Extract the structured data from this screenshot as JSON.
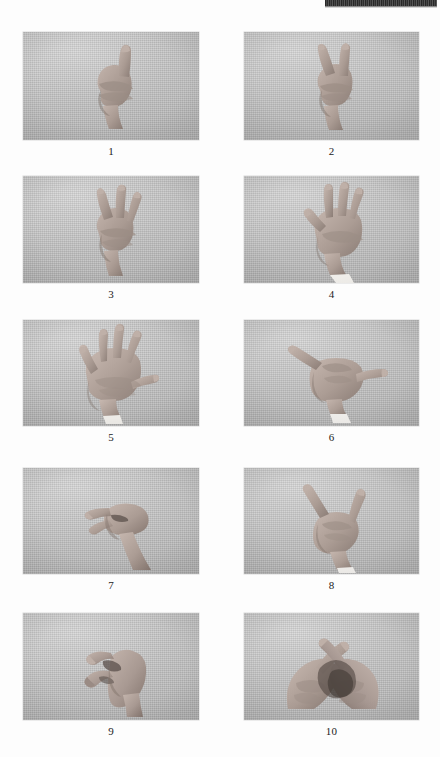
{
  "page": {
    "kind": "scanned-figure-plate",
    "background_color": "#fdfdfd",
    "photo_background_color": "#c2c2c2",
    "skin_color": "#b0a099",
    "caption_color": "#1b1b1b",
    "artifact_color": "#222222"
  },
  "artifact": {
    "name": "scan-edge-artifact",
    "description": ""
  },
  "figures": [
    {
      "number": "1",
      "caption": "1",
      "gesture": "index-finger-extended-one",
      "hand_count": 1,
      "sleeve_visible": false,
      "x": 23,
      "y": 32,
      "w": 176,
      "h": 108,
      "caption_y": 145
    },
    {
      "number": "2",
      "caption": "2",
      "gesture": "index-and-middle-finger-extended-two",
      "hand_count": 1,
      "sleeve_visible": false,
      "x": 244,
      "y": 32,
      "w": 175,
      "h": 108,
      "caption_y": 145
    },
    {
      "number": "3",
      "caption": "3",
      "gesture": "three-fingers-extended-three",
      "hand_count": 1,
      "sleeve_visible": false,
      "x": 23,
      "y": 176,
      "w": 176,
      "h": 107,
      "caption_y": 288
    },
    {
      "number": "4",
      "caption": "4",
      "gesture": "four-fingers-extended-four",
      "hand_count": 1,
      "sleeve_visible": true,
      "x": 244,
      "y": 176,
      "w": 175,
      "h": 107,
      "caption_y": 288
    },
    {
      "number": "5",
      "caption": "5",
      "gesture": "open-palm-five-fingers-five",
      "hand_count": 1,
      "sleeve_visible": true,
      "x": 23,
      "y": 320,
      "w": 176,
      "h": 106,
      "caption_y": 431
    },
    {
      "number": "6",
      "caption": "6",
      "gesture": "thumb-and-pinky-extended-shaka-six",
      "hand_count": 1,
      "sleeve_visible": true,
      "x": 244,
      "y": 320,
      "w": 175,
      "h": 106,
      "caption_y": 431
    },
    {
      "number": "7",
      "caption": "7",
      "gesture": "thumb-touching-fingers-pinch-seven",
      "hand_count": 1,
      "sleeve_visible": false,
      "x": 23,
      "y": 468,
      "w": 176,
      "h": 106,
      "caption_y": 579
    },
    {
      "number": "8",
      "caption": "8",
      "gesture": "index-and-thumb-extended-l-shape-eight",
      "hand_count": 1,
      "sleeve_visible": true,
      "x": 244,
      "y": 468,
      "w": 175,
      "h": 106,
      "caption_y": 579
    },
    {
      "number": "9",
      "caption": "9",
      "gesture": "curved-claw-hook-nine",
      "hand_count": 1,
      "sleeve_visible": false,
      "x": 23,
      "y": 613,
      "w": 176,
      "h": 107,
      "caption_y": 725
    },
    {
      "number": "10",
      "caption": "10",
      "gesture": "two-hands-crossed-index-fingers-ten",
      "hand_count": 2,
      "sleeve_visible": false,
      "x": 244,
      "y": 613,
      "w": 175,
      "h": 107,
      "caption_y": 725
    }
  ]
}
